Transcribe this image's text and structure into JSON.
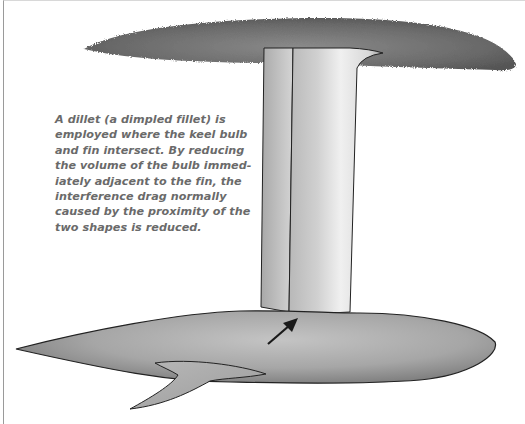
{
  "figure": {
    "caption_lines": [
      "A dillet (a dimpled fillet) is",
      "employed where the keel bulb",
      "and fin intersect. By reducing",
      "the volume of the bulb immed-",
      "iately adjacent to the fin, the",
      "interference drag normally",
      "caused by the proximity of the",
      "two shapes is reduced."
    ],
    "colors": {
      "hull": "#6e6e6e",
      "fin": "#dcdcdc",
      "bulb": "#a8a8a8",
      "text": "#6a6a6a",
      "arrow": "#1a1a1a"
    }
  }
}
